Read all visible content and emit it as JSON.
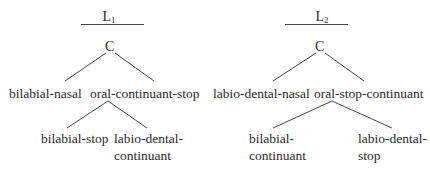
{
  "trees": [
    {
      "title": "L",
      "title_sub": "1",
      "root": "C",
      "children": [
        {
          "label": "bilabial-nasal"
        },
        {
          "label": "oral-continuant-stop",
          "children": [
            {
              "label_lines": [
                "bilabial-stop"
              ]
            },
            {
              "label_lines": [
                "labio-dental-",
                "continuant"
              ]
            }
          ]
        }
      ]
    },
    {
      "title": "L",
      "title_sub": "2",
      "root": "C",
      "children": [
        {
          "label": "labio-dental-nasal"
        },
        {
          "label": "oral-stop-continuant",
          "children": [
            {
              "label_lines": [
                "bilabial-",
                "continuant"
              ]
            },
            {
              "label_lines": [
                "labio-dental-",
                "stop"
              ]
            }
          ]
        }
      ]
    }
  ],
  "colors": {
    "line": "#444444",
    "text": "#2a2a2a"
  }
}
